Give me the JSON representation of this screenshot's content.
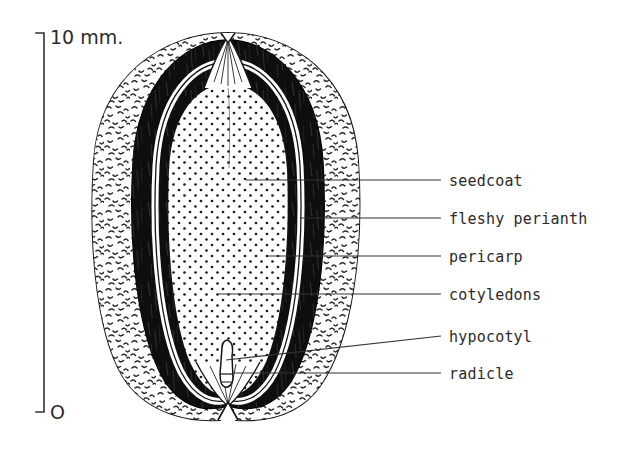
{
  "figure": {
    "background_color": "#ffffff",
    "ink_color": "#1a1a1a",
    "width": 632,
    "height": 452
  },
  "scale_bar": {
    "top_label": "10 mm.",
    "bottom_label": "O",
    "orientation": "vertical",
    "x": 44,
    "y_top": 33,
    "y_bottom": 412
  },
  "labels": [
    {
      "id": "seedcoat",
      "text": "seedcoat",
      "text_x": 449,
      "text_y": 186,
      "leader_x1": 341,
      "leader_y1": 180,
      "leader_x2": 441,
      "leader_y2": 180,
      "pointer_x": 246,
      "pointer_y": 180
    },
    {
      "id": "fleshy-perianth",
      "text": "fleshy perianth",
      "text_x": 449,
      "text_y": 224,
      "leader_x1": 341,
      "leader_y1": 218,
      "leader_x2": 441,
      "leader_y2": 218,
      "pointer_x": 300,
      "pointer_y": 218
    },
    {
      "id": "pericarp",
      "text": "pericarp",
      "text_x": 449,
      "text_y": 262,
      "leader_x1": 341,
      "leader_y1": 256,
      "leader_x2": 441,
      "leader_y2": 256,
      "pointer_x": 268,
      "pointer_y": 256
    },
    {
      "id": "cotyledons",
      "text": "cotyledons",
      "text_x": 449,
      "text_y": 300,
      "leader_x1": 341,
      "leader_y1": 294,
      "leader_x2": 441,
      "leader_y2": 294,
      "pointer_x": 218,
      "pointer_y": 294
    },
    {
      "id": "hypocotyl",
      "text": "hypocotyl",
      "text_x": 449,
      "text_y": 342,
      "leader_x1": 341,
      "leader_y1": 342,
      "leader_x2": 441,
      "leader_y2": 336,
      "pointer_x": 226,
      "pointer_y": 360
    },
    {
      "id": "radicle",
      "text": "radicle",
      "text_x": 449,
      "text_y": 379,
      "leader_x1": 341,
      "leader_y1": 373,
      "leader_x2": 441,
      "leader_y2": 373,
      "pointer_x": 232,
      "pointer_y": 373
    }
  ],
  "anatomy": {
    "layers": [
      {
        "name": "fleshy perianth",
        "render": "stippled",
        "fill": "#fdfdfd",
        "texture": "squiggle-dash"
      },
      {
        "name": "pericarp",
        "render": "solid-black",
        "fill": "#111111"
      },
      {
        "name": "seedcoat",
        "render": "thin-white-line",
        "fill": "#ffffff"
      },
      {
        "name": "cotyledons",
        "render": "dotted",
        "fill": "#ffffff",
        "texture": "round-dot-grid"
      },
      {
        "name": "hypocotyl",
        "render": "outline"
      },
      {
        "name": "radicle",
        "render": "outline"
      }
    ],
    "apex_notch_top": true,
    "apex_notch_bottom": true
  }
}
